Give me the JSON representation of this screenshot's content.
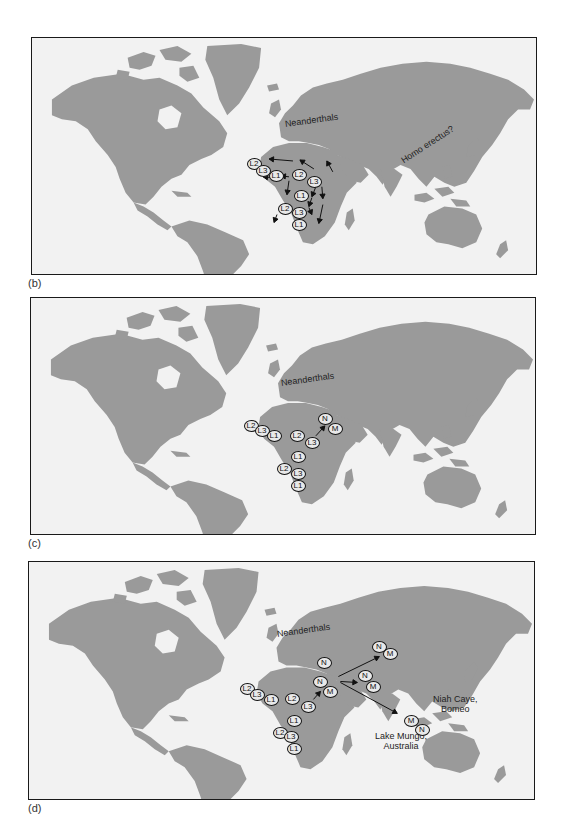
{
  "figure": {
    "panels": [
      {
        "id": "b",
        "label": "(b)",
        "region_labels": [
          {
            "text": "Neanderthals",
            "x": 253,
            "y": 88,
            "rotate": -8
          },
          {
            "text": "Homo erectus?",
            "x": 372,
            "y": 111,
            "rotate": -33
          }
        ],
        "markers": [
          {
            "text": "L2",
            "x": 222,
            "y": 126
          },
          {
            "text": "L3",
            "x": 231,
            "y": 133
          },
          {
            "text": "L1",
            "x": 244,
            "y": 138
          },
          {
            "text": "L2",
            "x": 267,
            "y": 137
          },
          {
            "text": "L3",
            "x": 282,
            "y": 144
          },
          {
            "text": "L1",
            "x": 269,
            "y": 158
          },
          {
            "text": "L2",
            "x": 253,
            "y": 171
          },
          {
            "text": "L3",
            "x": 267,
            "y": 175
          },
          {
            "text": "L1",
            "x": 267,
            "y": 187
          }
        ],
        "arrows": [
          {
            "x1": 262,
            "y1": 124,
            "x2": 238,
            "y2": 122
          },
          {
            "x1": 283,
            "y1": 132,
            "x2": 269,
            "y2": 123
          },
          {
            "x1": 302,
            "y1": 135,
            "x2": 296,
            "y2": 124
          },
          {
            "x1": 258,
            "y1": 140,
            "x2": 250,
            "y2": 139
          },
          {
            "x1": 243,
            "y1": 141,
            "x2": 232,
            "y2": 140
          },
          {
            "x1": 258,
            "y1": 144,
            "x2": 256,
            "y2": 158
          },
          {
            "x1": 285,
            "y1": 150,
            "x2": 281,
            "y2": 160
          },
          {
            "x1": 291,
            "y1": 150,
            "x2": 292,
            "y2": 162
          },
          {
            "x1": 281,
            "y1": 161,
            "x2": 278,
            "y2": 170
          },
          {
            "x1": 292,
            "y1": 168,
            "x2": 288,
            "y2": 187
          },
          {
            "x1": 278,
            "y1": 171,
            "x2": 281,
            "y2": 178
          },
          {
            "x1": 246,
            "y1": 178,
            "x2": 243,
            "y2": 186
          }
        ]
      },
      {
        "id": "c",
        "label": "(c)",
        "region_labels": [
          {
            "text": "Neanderthals",
            "x": 250,
            "y": 87,
            "rotate": -8
          }
        ],
        "markers": [
          {
            "text": "L2",
            "x": 220,
            "y": 128
          },
          {
            "text": "L3",
            "x": 231,
            "y": 133
          },
          {
            "text": "L1",
            "x": 243,
            "y": 138
          },
          {
            "text": "L2",
            "x": 266,
            "y": 138
          },
          {
            "text": "L3",
            "x": 281,
            "y": 145
          },
          {
            "text": "L1",
            "x": 267,
            "y": 159
          },
          {
            "text": "L2",
            "x": 253,
            "y": 171
          },
          {
            "text": "L3",
            "x": 267,
            "y": 176
          },
          {
            "text": "L1",
            "x": 267,
            "y": 188
          },
          {
            "text": "N",
            "x": 294,
            "y": 121
          },
          {
            "text": "M",
            "x": 304,
            "y": 131
          }
        ],
        "arrows": [
          {
            "x1": 286,
            "y1": 139,
            "x2": 295,
            "y2": 129
          }
        ]
      },
      {
        "id": "d",
        "label": "(d)",
        "region_labels": [
          {
            "text": "Neanderthals",
            "x": 248,
            "y": 74,
            "rotate": -8
          }
        ],
        "site_labels": [
          {
            "lines": [
              "Niah Caye,",
              "Bomeo"
            ],
            "x": 402,
            "y": 138
          },
          {
            "lines": [
              "Lake Mungo,",
              "Australia"
            ],
            "x": 350,
            "y": 175
          }
        ],
        "markers": [
          {
            "text": "L2",
            "x": 218,
            "y": 127
          },
          {
            "text": "L3",
            "x": 228,
            "y": 133
          },
          {
            "text": "L1",
            "x": 242,
            "y": 138
          },
          {
            "text": "L2",
            "x": 263,
            "y": 137
          },
          {
            "text": "L3",
            "x": 279,
            "y": 145
          },
          {
            "text": "L1",
            "x": 265,
            "y": 159
          },
          {
            "text": "L2",
            "x": 251,
            "y": 171
          },
          {
            "text": "L3",
            "x": 262,
            "y": 175
          },
          {
            "text": "L1",
            "x": 265,
            "y": 187
          },
          {
            "text": "N",
            "x": 295,
            "y": 101
          },
          {
            "text": "N",
            "x": 291,
            "y": 120
          },
          {
            "text": "M",
            "x": 301,
            "y": 130
          },
          {
            "text": "N",
            "x": 350,
            "y": 85
          },
          {
            "text": "M",
            "x": 361,
            "y": 92
          },
          {
            "text": "N",
            "x": 336,
            "y": 114
          },
          {
            "text": "M",
            "x": 344,
            "y": 125
          },
          {
            "text": "M",
            "x": 382,
            "y": 159
          },
          {
            "text": "N",
            "x": 393,
            "y": 168
          }
        ],
        "arrows": [
          {
            "x1": 285,
            "y1": 138,
            "x2": 292,
            "y2": 130
          },
          {
            "x1": 310,
            "y1": 115,
            "x2": 351,
            "y2": 95
          },
          {
            "x1": 312,
            "y1": 120,
            "x2": 329,
            "y2": 121
          },
          {
            "x1": 312,
            "y1": 121,
            "x2": 369,
            "y2": 152
          }
        ]
      }
    ]
  },
  "colors": {
    "land": "#9a9a9a",
    "ocean": "#f2f2f2",
    "border": "#1a1a1a",
    "marker_fill": "#e9e9e9",
    "ink": "#111111"
  }
}
